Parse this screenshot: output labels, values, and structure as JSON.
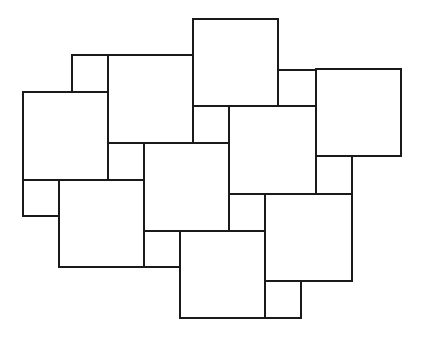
{
  "diagram": {
    "type": "pythagorean-tiling",
    "stroke_color": "#1a1a1a",
    "background": "#ffffff",
    "large_squares": [
      {
        "id": "A",
        "x": 23,
        "y": 92,
        "w": 85,
        "h": 88
      },
      {
        "id": "B",
        "x": 108,
        "y": 55,
        "w": 85,
        "h": 88
      },
      {
        "id": "C",
        "x": 193,
        "y": 19,
        "w": 85,
        "h": 87
      },
      {
        "id": "D",
        "x": 316,
        "y": 69,
        "w": 85,
        "h": 87
      },
      {
        "id": "E",
        "x": 229,
        "y": 106,
        "w": 87,
        "h": 88
      },
      {
        "id": "F",
        "x": 144,
        "y": 143,
        "w": 85,
        "h": 88
      },
      {
        "id": "G",
        "x": 59,
        "y": 180,
        "w": 85,
        "h": 87
      },
      {
        "id": "H",
        "x": 180,
        "y": 231,
        "w": 85,
        "h": 87
      },
      {
        "id": "I",
        "x": 265,
        "y": 194,
        "w": 87,
        "h": 87
      }
    ],
    "small_squares": [
      {
        "id": "a",
        "x": 72,
        "y": 55,
        "w": 36,
        "h": 37
      },
      {
        "id": "b",
        "x": 278,
        "y": 70,
        "w": 38,
        "h": 36
      },
      {
        "id": "c",
        "x": 193,
        "y": 106,
        "w": 36,
        "h": 37
      },
      {
        "id": "d",
        "x": 108,
        "y": 143,
        "w": 36,
        "h": 37
      },
      {
        "id": "e",
        "x": 23,
        "y": 180,
        "w": 36,
        "h": 36
      },
      {
        "id": "f",
        "x": 144,
        "y": 231,
        "w": 36,
        "h": 36
      },
      {
        "id": "g",
        "x": 229,
        "y": 194,
        "w": 36,
        "h": 37
      },
      {
        "id": "h",
        "x": 316,
        "y": 156,
        "w": 36,
        "h": 38
      },
      {
        "id": "i",
        "x": 265,
        "y": 281,
        "w": 36,
        "h": 37
      }
    ]
  }
}
